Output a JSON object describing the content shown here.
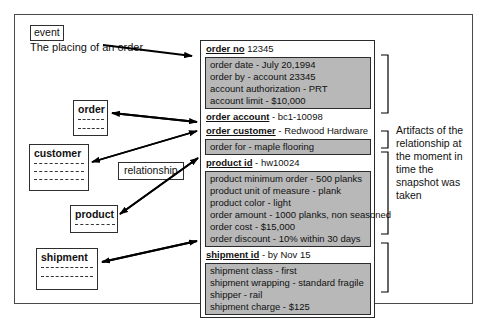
{
  "diagram": {
    "title_tag": "event",
    "event_caption": "The placing of an order",
    "relationship_tag": "relationship",
    "annotation": "Artifacts of the relationship at the moment in time the snapshot was taken",
    "frame_color": "#4a4a4a",
    "detail_fill_color": "#b8b8b8",
    "line_color": "#000000"
  },
  "entities": [
    {
      "name": "order",
      "rules": 2
    },
    {
      "name": "customer",
      "rules": 3
    },
    {
      "name": "product",
      "rules": 1
    },
    {
      "name": "shipment",
      "rules": 2
    }
  ],
  "snapshot": {
    "groups": [
      {
        "header_label": "order no",
        "header_value": "12345",
        "header_underline": false,
        "details": [
          "order date - July 20,1994",
          "order by - account 23345",
          "account authorization - PRT",
          "account limit - $10,000"
        ]
      },
      {
        "header_label": "order account",
        "header_value": "- bc1-10098",
        "header_underline": true,
        "details": []
      },
      {
        "header_label": "order customer",
        "header_value": "- Redwood Hardware",
        "header_underline": true,
        "details": [
          "order for - maple flooring"
        ]
      },
      {
        "header_label": "product id",
        "header_value": "- hw10024",
        "header_underline": true,
        "details": [
          "product minimum order - 500 planks",
          "product unit of measure - plank",
          "product color - light",
          "order amount - 1000 planks, non seasoned",
          "order cost - $15,000",
          "order discount - 10% within 30 days"
        ]
      },
      {
        "header_label": "shipment id",
        "header_value": "-  by Nov 15",
        "header_underline": true,
        "details": [
          "shipment class - first",
          "shipment wrapping - standard fragile",
          "shipper - rail",
          "shipment charge - $125"
        ]
      }
    ]
  }
}
